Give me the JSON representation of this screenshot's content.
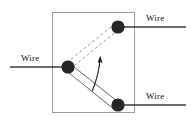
{
  "figure": {
    "name": "hinged-contact-switch-diagram",
    "background_color": "#ffffff",
    "width": 193,
    "height": 123
  },
  "enclosure": {
    "name": "enclosure-box",
    "stroke_color": "#9a9a9a",
    "stroke_width": 1,
    "x": 52,
    "y": 12,
    "width": 83,
    "height": 101
  },
  "nodes": [
    {
      "id": "pivot",
      "label": "pivot-contact-node",
      "cx": 68,
      "cy": 67,
      "r": 6.5,
      "color": "#262626"
    },
    {
      "id": "upper",
      "label": "upper-contact-node",
      "cx": 118,
      "cy": 27,
      "r": 6.5,
      "color": "#262626"
    },
    {
      "id": "lower",
      "label": "lower-contact-node",
      "cx": 118,
      "cy": 105,
      "r": 6.5,
      "color": "#262626"
    }
  ],
  "wires": [
    {
      "id": "wire-left",
      "label": "Wire",
      "x1": 10,
      "y1": 67,
      "x2": 68,
      "y2": 67,
      "color": "#3a3a3a",
      "stroke_width": 1.6
    },
    {
      "id": "wire-top-right",
      "label": "Wire",
      "x1": 118,
      "y1": 27,
      "x2": 186,
      "y2": 27,
      "color": "#3a3a3a",
      "stroke_width": 1.6
    },
    {
      "id": "wire-bottom-right",
      "label": "Wire",
      "x1": 118,
      "y1": 105,
      "x2": 186,
      "y2": 105,
      "color": "#3a3a3a",
      "stroke_width": 1.6
    }
  ],
  "arms": [
    {
      "id": "arm-upper-dashed",
      "style": "dashed",
      "note": "alternate (raised) position of the pivoting arm, drawn as a thin open bar",
      "color": "#8c8c8c",
      "dash": "3 2.4",
      "stroke_width": 0.9
    },
    {
      "id": "arm-lower-solid",
      "style": "solid",
      "note": "current (lowered) position of the pivoting arm, drawn as a thin open bar",
      "color": "#555555",
      "stroke_width": 0.9
    }
  ],
  "rotation_arrow": {
    "name": "rotation-direction-arrow",
    "note": "curved arrow indicating the arm swings upward about the pivot",
    "color": "#1a1a1a",
    "stroke_width": 1.1,
    "direction": "counter-clockwise-upward"
  },
  "labels": {
    "top_right": "Wire",
    "left": "Wire",
    "bottom_right": "Wire"
  }
}
